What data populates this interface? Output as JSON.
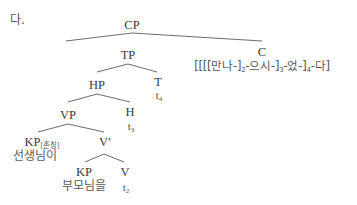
{
  "example_label": "다.",
  "nodes": {
    "cp": "CP",
    "tp": "TP",
    "c": "C",
    "hp": "HP",
    "t": "T",
    "vp": "VP",
    "h": "H",
    "kp_subj": "KP",
    "kp_subj_feature": "[존칭]",
    "vbar": "V′",
    "kp_obj": "KP",
    "v": "V"
  },
  "terminals": {
    "c_string_parts": [
      "[[[[만나-]",
      "2",
      "-으시-]",
      "3",
      "-었-]",
      "4",
      "-다]"
    ],
    "t_trace": "t",
    "t_trace_index": "4",
    "h_trace": "t",
    "h_trace_index": "3",
    "v_trace": "t",
    "v_trace_index": "2",
    "kp_subj_word": "선생님이",
    "kp_obj_word": "부모님을"
  }
}
